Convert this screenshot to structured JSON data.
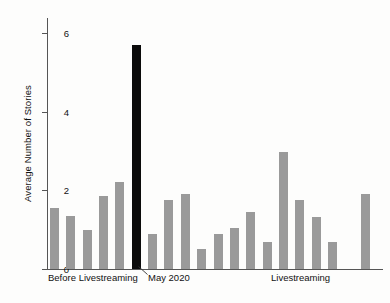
{
  "figure": {
    "ylabel": "Average Number of Stories"
  },
  "axis": {
    "y_ticks": [
      "0",
      "2",
      "4",
      "6"
    ]
  },
  "xlabels": {
    "before": "Before Livestreaming",
    "event": "May 2020",
    "after": "Livestreaming"
  },
  "chart_data": {
    "type": "bar",
    "title": "",
    "xlabel": "",
    "ylabel": "Average Number of Stories",
    "ylim": [
      0,
      6.3
    ],
    "yticks": [
      0,
      2,
      4,
      6
    ],
    "grid": false,
    "legend": null,
    "bar_color": "#9a9a9a",
    "highlight_color": "#0b0b0b",
    "annotations": [
      {
        "text": "Before Livestreaming",
        "x_index_range": [
          0,
          4
        ],
        "position": "below-axis"
      },
      {
        "text": "May 2020",
        "x_index": 5,
        "position": "below-axis",
        "leader_line": true
      },
      {
        "text": "Livestreaming",
        "x_index_range": [
          6,
          21
        ],
        "position": "below-axis"
      }
    ],
    "categories": [
      "1",
      "2",
      "3",
      "4",
      "5",
      "6",
      "7",
      "8",
      "9",
      "10",
      "11",
      "12",
      "13",
      "14",
      "15",
      "16",
      "17",
      "18",
      "19",
      "20",
      "21",
      "22"
    ],
    "values": [
      1.55,
      1.35,
      1.0,
      1.85,
      2.2,
      5.7,
      0.9,
      1.75,
      1.9,
      0.5,
      0.88,
      1.05,
      1.45,
      0.68,
      2.98,
      1.75,
      1.33,
      0.68,
      null,
      1.9,
      null,
      null
    ],
    "bars": [
      {
        "index": 0,
        "value": 1.55,
        "highlight": false
      },
      {
        "index": 1,
        "value": 1.35,
        "highlight": false
      },
      {
        "index": 2,
        "value": 1.0,
        "highlight": false
      },
      {
        "index": 3,
        "value": 1.85,
        "highlight": false
      },
      {
        "index": 4,
        "value": 2.2,
        "highlight": false
      },
      {
        "index": 5,
        "value": 5.7,
        "highlight": true
      },
      {
        "index": 6,
        "value": 0.9,
        "highlight": false
      },
      {
        "index": 7,
        "value": 1.75,
        "highlight": false
      },
      {
        "index": 8,
        "value": 1.9,
        "highlight": false
      },
      {
        "index": 9,
        "value": 0.5,
        "highlight": false
      },
      {
        "index": 10,
        "value": 0.88,
        "highlight": false
      },
      {
        "index": 11,
        "value": 1.05,
        "highlight": false
      },
      {
        "index": 12,
        "value": 1.45,
        "highlight": false
      },
      {
        "index": 13,
        "value": 0.68,
        "highlight": false
      },
      {
        "index": 14,
        "value": 2.98,
        "highlight": false
      },
      {
        "index": 15,
        "value": 1.75,
        "highlight": false
      },
      {
        "index": 16,
        "value": 1.33,
        "highlight": false
      },
      {
        "index": 17,
        "value": 0.68,
        "highlight": false
      },
      {
        "index": 19,
        "value": 1.9,
        "highlight": false
      }
    ]
  }
}
